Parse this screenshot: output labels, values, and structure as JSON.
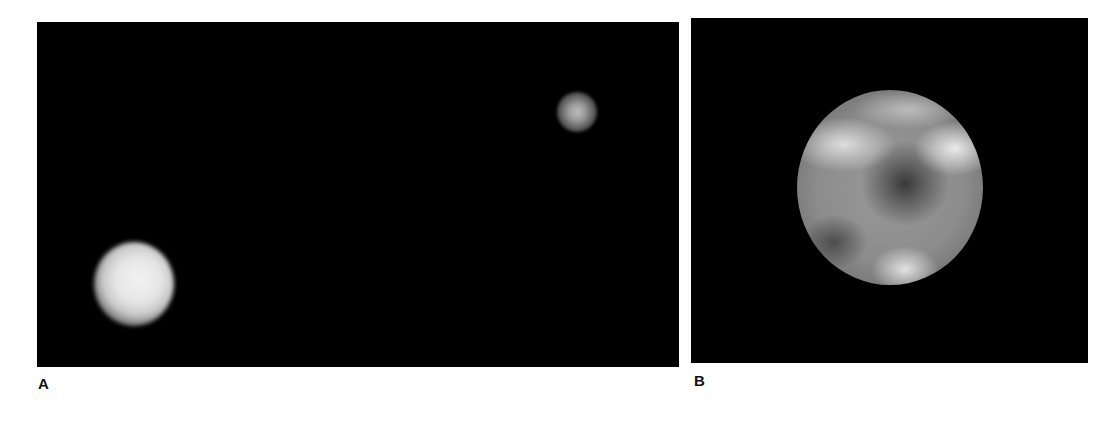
{
  "figure": {
    "panels": [
      {
        "id": "A",
        "label": "A",
        "background_color": "#000000",
        "objects": [
          {
            "description": "large blurred bright disk",
            "tone": "#e6e6e6"
          },
          {
            "description": "small blurred faint disk",
            "tone": "#9a9a9a"
          }
        ]
      },
      {
        "id": "B",
        "label": "B",
        "background_color": "#000000",
        "objects": [
          {
            "description": "gray sphere with mottled light and dark surface regions",
            "tone": "#8c8c8c"
          }
        ]
      }
    ]
  }
}
